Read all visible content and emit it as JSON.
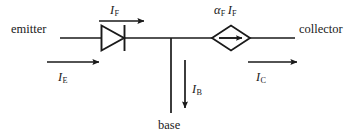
{
  "diagram": {
    "type": "circuit-schematic",
    "stroke_color": "#1a1a1a",
    "background_color": "#ffffff",
    "terminals": [
      {
        "id": "emitter",
        "label": "emitter",
        "position": "left"
      },
      {
        "id": "collector",
        "label": "collector",
        "position": "right"
      },
      {
        "id": "base",
        "label": "base",
        "position": "bottom"
      }
    ],
    "components": [
      {
        "id": "forward-diode",
        "type": "diode",
        "orientation": "right",
        "label": "I",
        "label_sub": "F",
        "label_full": "IF"
      },
      {
        "id": "dependent-current-source",
        "type": "dependent-current-source",
        "shape": "diamond",
        "arrow_direction": "right",
        "label_alpha": "α",
        "label_alpha_sub": "F",
        "label_current": "I",
        "label_current_sub": "F",
        "label_full": "αF IF"
      }
    ],
    "currents": [
      {
        "id": "i-f",
        "symbol": "I",
        "subscript": "F",
        "full": "IF",
        "direction": "right",
        "location": "above-diode"
      },
      {
        "id": "i-e",
        "symbol": "I",
        "subscript": "E",
        "full": "IE",
        "direction": "right",
        "location": "emitter-lower"
      },
      {
        "id": "i-b",
        "symbol": "I",
        "subscript": "B",
        "full": "IB",
        "direction": "down",
        "location": "base-branch"
      },
      {
        "id": "i-c",
        "symbol": "I",
        "subscript": "C",
        "full": "IC",
        "direction": "right",
        "location": "collector-lower"
      }
    ]
  }
}
